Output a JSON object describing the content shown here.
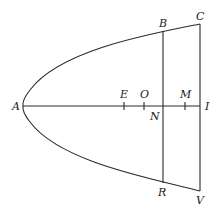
{
  "diagram": {
    "type": "geometric-figure",
    "labels": {
      "A": "A",
      "B": "B",
      "C": "C",
      "E": "E",
      "O": "O",
      "M": "M",
      "N": "N",
      "I": "I",
      "R": "R",
      "V": "V"
    },
    "points": {
      "A": [
        23,
        106
      ],
      "B": [
        163,
        31
      ],
      "C": [
        200,
        24
      ],
      "E": [
        124,
        106
      ],
      "O": [
        144,
        106
      ],
      "N": [
        163,
        106
      ],
      "M": [
        185,
        106
      ],
      "I": [
        200,
        106
      ],
      "R": [
        163,
        183
      ],
      "V": [
        200,
        191
      ]
    },
    "segments": [
      [
        "A",
        "I"
      ],
      [
        "B",
        "R"
      ],
      [
        "C",
        "V"
      ]
    ],
    "curves": [
      {
        "name": "parabola",
        "vertex": "A",
        "through": [
          "B",
          "C",
          "R",
          "V"
        ]
      }
    ],
    "ticks": [
      "E",
      "O",
      "M"
    ],
    "colors": {
      "stroke": "#2a2a2a",
      "text": "#1a1a1a",
      "background": "#ffffff"
    }
  }
}
